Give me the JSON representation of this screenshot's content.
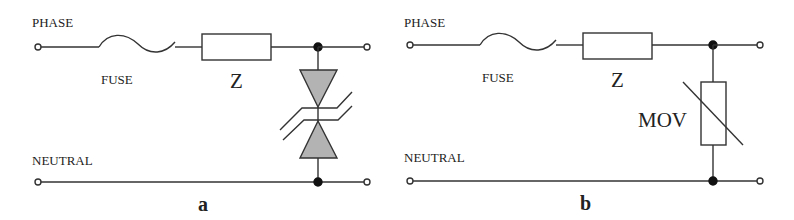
{
  "figure": {
    "panels": [
      {
        "id": "a",
        "caption": "a",
        "labels": {
          "phase": "PHASE",
          "neutral": "NEUTRAL",
          "fuse": "FUSE",
          "impedance": "Z"
        },
        "protector": "bidirectional TVS diode"
      },
      {
        "id": "b",
        "caption": "b",
        "labels": {
          "phase": "PHASE",
          "neutral": "NEUTRAL",
          "fuse": "FUSE",
          "impedance": "Z",
          "protector": "MOV"
        },
        "protector": "metal oxide varistor"
      }
    ],
    "colors": {
      "line": "#333333",
      "diode_fill": "#b3b3b3",
      "background": "#ffffff"
    }
  }
}
